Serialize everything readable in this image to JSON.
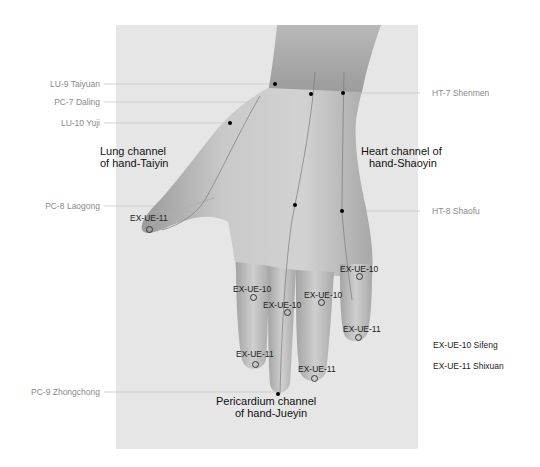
{
  "colors": {
    "panel": "#e6e6e6",
    "skin_dark": "#8e8e8e",
    "skin_light": "#d4d4d4",
    "side_label": "#8a8a8a",
    "leader_line": "#c8c8c8",
    "point": "#000000"
  },
  "side_labels_left": [
    {
      "id": "lu9",
      "text": "LU-9 Taiyuan"
    },
    {
      "id": "pc7",
      "text": "PC-7 Daling"
    },
    {
      "id": "lu10",
      "text": "LU-10 Yuji"
    },
    {
      "id": "pc8",
      "text": "PC-8 Laogong"
    },
    {
      "id": "pc9",
      "text": "PC-9 Zhongchong"
    }
  ],
  "side_labels_right": [
    {
      "id": "ht7",
      "text": "HT-7 Shenmen"
    },
    {
      "id": "ht8",
      "text": "HT-8 Shaofu"
    }
  ],
  "channels": {
    "lung": {
      "line1": "Lung channel",
      "line2": "of hand-Taiyin"
    },
    "heart": {
      "line1": "Heart channel of",
      "line2": "hand-Shaoyin"
    },
    "pericardium": {
      "line1": "Pericardium channel",
      "line2": "of hand-Jueyin"
    }
  },
  "extra_points": [
    {
      "text": "EX-UE-11",
      "finger": "thumb"
    },
    {
      "text": "EX-UE-10",
      "finger": "index"
    },
    {
      "text": "EX-UE-10",
      "finger": "middle"
    },
    {
      "text": "EX-UE-10",
      "finger": "ring"
    },
    {
      "text": "EX-UE-10",
      "finger": "little"
    },
    {
      "text": "EX-UE-11",
      "finger": "index"
    },
    {
      "text": "EX-UE-11",
      "finger": "ring"
    },
    {
      "text": "EX-UE-11",
      "finger": "little"
    }
  ],
  "legend": [
    {
      "text": "EX-UE-10 Sifeng"
    },
    {
      "text": "EX-UE-11 Shixuan"
    }
  ]
}
